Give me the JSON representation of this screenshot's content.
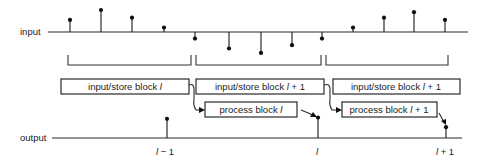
{
  "diagram": {
    "input_label": "input",
    "output_label": "output",
    "input_samples": [
      {
        "index": 1,
        "sign": "up",
        "value": 0.55
      },
      {
        "index": 2,
        "sign": "up",
        "value": 1.0
      },
      {
        "index": 3,
        "sign": "up",
        "value": 0.65
      },
      {
        "index": 4,
        "sign": "up",
        "value": 0.2
      },
      {
        "index": 5,
        "sign": "down",
        "value": -0.3
      },
      {
        "index": 6,
        "sign": "down",
        "value": -0.75
      },
      {
        "index": 7,
        "sign": "down",
        "value": -0.95
      },
      {
        "index": 8,
        "sign": "down",
        "value": -0.6
      },
      {
        "index": 9,
        "sign": "down",
        "value": -0.3
      },
      {
        "index": 10,
        "sign": "up",
        "value": 0.2
      },
      {
        "index": 11,
        "sign": "up",
        "value": 0.65
      },
      {
        "index": 12,
        "sign": "up",
        "value": 0.9
      },
      {
        "index": 13,
        "sign": "up",
        "value": 0.55
      }
    ],
    "blocks_brackets": 3,
    "store_blocks": [
      {
        "prefix": "input/store block ",
        "var": "l",
        "suffix": ""
      },
      {
        "prefix": "input/store block ",
        "var": "l",
        "suffix": " + 1"
      },
      {
        "prefix": "input/store block ",
        "var": "l",
        "suffix": " + 1"
      }
    ],
    "process_blocks": [
      {
        "prefix": "process block ",
        "var": "l",
        "suffix": ""
      },
      {
        "prefix": "process block ",
        "var": "l",
        "suffix": " + 1"
      }
    ],
    "output_samples": [
      {
        "label_var": "l",
        "label_suffix": " − 1",
        "value": 0.8
      },
      {
        "label_var": "l",
        "label_suffix": "",
        "value": 0.85
      },
      {
        "label_var": "l",
        "label_suffix": " + 1",
        "value": 0.45
      }
    ]
  }
}
